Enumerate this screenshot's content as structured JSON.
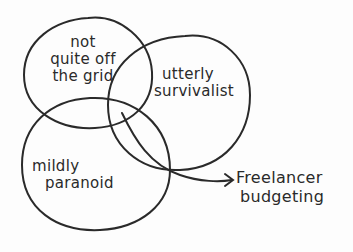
{
  "diagram": {
    "type": "venn",
    "style": "hand-drawn",
    "stroke_color": "#2a2a2a",
    "background": "#fdfdfd",
    "sets": [
      {
        "id": "a",
        "lines": [
          "not",
          "quite off",
          "the grid"
        ]
      },
      {
        "id": "b",
        "lines": [
          "utterly",
          "survivalist"
        ]
      },
      {
        "id": "c",
        "lines": [
          "mildly",
          "paranoid"
        ]
      }
    ],
    "intersection_callout": {
      "points_to": "a ∩ b ∩ c",
      "lines": [
        "Freelancer",
        "budgeting"
      ]
    }
  }
}
